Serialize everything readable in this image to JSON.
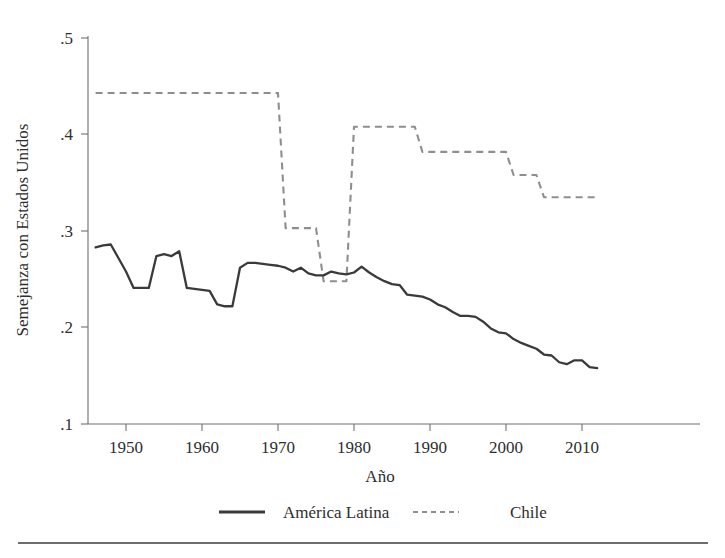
{
  "chart_data": {
    "type": "line",
    "title": "",
    "xlabel": "Año",
    "ylabel": "Semejanza con Estados Unidos",
    "xlim": [
      1946,
      2012
    ],
    "ylim": [
      0.1,
      0.5
    ],
    "grid": false,
    "legend_position": "bottom",
    "xticks": [
      1950,
      1960,
      1970,
      1980,
      1990,
      2000,
      2010
    ],
    "xtick_labels": [
      "1950",
      "1960",
      "1970",
      "1980",
      "1990",
      "2000",
      "2010"
    ],
    "yticks": [
      0.1,
      0.2,
      0.3,
      0.4,
      0.5
    ],
    "ytick_labels": [
      ".1",
      ".2",
      ".3",
      ".4",
      ".5"
    ],
    "x": [
      1946,
      1947,
      1948,
      1949,
      1950,
      1951,
      1952,
      1953,
      1954,
      1955,
      1956,
      1957,
      1958,
      1959,
      1960,
      1961,
      1962,
      1963,
      1964,
      1965,
      1966,
      1967,
      1968,
      1969,
      1970,
      1971,
      1972,
      1973,
      1974,
      1975,
      1976,
      1977,
      1978,
      1979,
      1980,
      1981,
      1982,
      1983,
      1984,
      1985,
      1986,
      1987,
      1988,
      1989,
      1990,
      1991,
      1992,
      1993,
      1994,
      1995,
      1996,
      1997,
      1998,
      1999,
      2000,
      2001,
      2002,
      2003,
      2004,
      2005,
      2006,
      2007,
      2008,
      2009,
      2010,
      2011,
      2012
    ],
    "series": [
      {
        "name": "América Latina",
        "style": "solid",
        "color": "#3a3a3a",
        "values": [
          0.283,
          0.285,
          0.286,
          0.272,
          0.258,
          0.241,
          0.241,
          0.241,
          0.274,
          0.276,
          0.274,
          0.279,
          0.241,
          0.24,
          0.239,
          0.238,
          0.224,
          0.222,
          0.222,
          0.262,
          0.267,
          0.267,
          0.266,
          0.265,
          0.264,
          0.262,
          0.258,
          0.262,
          0.256,
          0.254,
          0.254,
          0.258,
          0.256,
          0.255,
          0.257,
          0.263,
          0.257,
          0.252,
          0.248,
          0.245,
          0.244,
          0.234,
          0.233,
          0.232,
          0.229,
          0.224,
          0.221,
          0.216,
          0.212,
          0.212,
          0.211,
          0.206,
          0.199,
          0.195,
          0.194,
          0.188,
          0.184,
          0.181,
          0.178,
          0.172,
          0.171,
          0.164,
          0.162,
          0.166,
          0.166,
          0.159,
          0.158
        ]
      },
      {
        "name": "Chile",
        "style": "dashed",
        "color": "#8e8e8e",
        "values": [
          0.443,
          0.443,
          0.443,
          0.443,
          0.443,
          0.443,
          0.443,
          0.443,
          0.443,
          0.443,
          0.443,
          0.443,
          0.443,
          0.443,
          0.443,
          0.443,
          0.443,
          0.443,
          0.443,
          0.443,
          0.443,
          0.443,
          0.443,
          0.443,
          0.443,
          0.303,
          0.303,
          0.303,
          0.303,
          0.303,
          0.248,
          0.248,
          0.248,
          0.248,
          0.408,
          0.408,
          0.408,
          0.408,
          0.408,
          0.408,
          0.408,
          0.408,
          0.408,
          0.382,
          0.382,
          0.382,
          0.382,
          0.382,
          0.382,
          0.382,
          0.382,
          0.382,
          0.382,
          0.382,
          0.382,
          0.358,
          0.358,
          0.358,
          0.358,
          0.335,
          0.335,
          0.335,
          0.335,
          0.335,
          0.335,
          0.335,
          0.335
        ]
      }
    ]
  },
  "axes": {
    "y_axis_title": "Semejanza con Estados Unidos",
    "x_axis_title": "Año",
    "ytick_labels": [
      ".5",
      ".4",
      ".3",
      ".2",
      ".1"
    ],
    "xtick_labels": [
      "1950",
      "1960",
      "1970",
      "1980",
      "1990",
      "2000",
      "2010"
    ]
  },
  "legend": {
    "entries": [
      {
        "label": "América Latina",
        "style": "solid"
      },
      {
        "label": "Chile",
        "style": "dashed"
      }
    ]
  }
}
